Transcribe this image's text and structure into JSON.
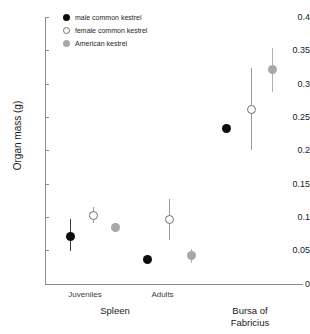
{
  "chart_data": {
    "type": "scatter",
    "title": "",
    "xlabel": "",
    "ylabel": "Organ mass (g)",
    "ylim": [
      0,
      0.4
    ],
    "ytick_labels": [
      "0.4",
      "0.35",
      "0.3",
      "0.25",
      "0.2",
      "0.15",
      "0.1",
      "0.05",
      "0"
    ],
    "ytick_values": [
      0.4,
      0.35,
      0.3,
      0.25,
      0.2,
      0.15,
      0.1,
      0.05,
      0
    ],
    "grid": false,
    "legend_position": "top-left",
    "legend": [
      "male common kestrel",
      "female common kestrel",
      "American kestrel"
    ],
    "x_groups": [
      {
        "major": "Spleen",
        "minor": "Juveniles"
      },
      {
        "major": "Spleen",
        "minor": "Adults"
      },
      {
        "major": "Bursa of Fabricius",
        "minor": ""
      }
    ],
    "series": [
      {
        "name": "male common kestrel",
        "color": "#0d0d0d",
        "marker": "filled-circle",
        "points": [
          {
            "group": "Spleen Juveniles",
            "value": 0.071,
            "err_low": 0.049,
            "err_high": 0.098
          },
          {
            "group": "Spleen Adults",
            "value": 0.037,
            "err_low": 0.033,
            "err_high": 0.041
          },
          {
            "group": "Bursa of Fabricius",
            "value": 0.233,
            "err_low": 0.233,
            "err_high": 0.233
          }
        ]
      },
      {
        "name": "female common kestrel",
        "color": "#ffffff",
        "marker": "open-circle",
        "points": [
          {
            "group": "Spleen Juveniles",
            "value": 0.103,
            "err_low": 0.092,
            "err_high": 0.116
          },
          {
            "group": "Spleen Adults",
            "value": 0.096,
            "err_low": 0.066,
            "err_high": 0.127
          },
          {
            "group": "Bursa of Fabricius",
            "value": 0.261,
            "err_low": 0.2,
            "err_high": 0.323
          }
        ]
      },
      {
        "name": "American kestrel",
        "color": "#a8a8a8",
        "marker": "grey-circle",
        "points": [
          {
            "group": "Spleen Juveniles",
            "value": 0.085,
            "err_low": 0.078,
            "err_high": 0.091
          },
          {
            "group": "Spleen Adults",
            "value": 0.042,
            "err_low": 0.031,
            "err_high": 0.053
          },
          {
            "group": "Bursa of Fabricius",
            "value": 0.322,
            "err_low": 0.288,
            "err_high": 0.353
          }
        ]
      }
    ]
  },
  "axis": {
    "y_title": "Organ mass (g)"
  },
  "legend": {
    "items": [
      {
        "label": "male common kestrel"
      },
      {
        "label": "female common kestrel"
      },
      {
        "label": "American kestrel"
      }
    ]
  },
  "x_labels": {
    "juveniles": "Juveniles",
    "adults": "Adults",
    "spleen": "Spleen",
    "bursa_line1": "Bursa of",
    "bursa_line2": "Fabricius"
  },
  "ticks": {
    "t0": "0.4",
    "t1": "0.35",
    "t2": "0.3",
    "t3": "0.25",
    "t4": "0.2",
    "t5": "0.15",
    "t6": "0.1",
    "t7": "0.05",
    "t8": "0"
  }
}
